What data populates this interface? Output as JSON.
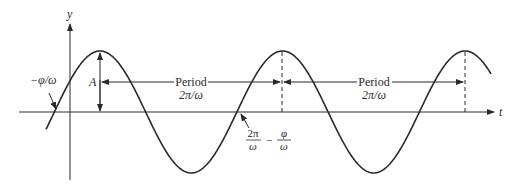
{
  "diagram": {
    "type": "sinusoid",
    "axes": {
      "y_label": "y",
      "x_label": "t"
    },
    "labels": {
      "amplitude": "A",
      "phase_shift": "−φ/ω",
      "period1_title": "Period",
      "period1_value": "2π/ω",
      "period2_title": "Period",
      "period2_value": "2π/ω",
      "zero_crossing_num1": "2π",
      "zero_crossing_den1": "ω",
      "zero_crossing_minus": "−",
      "zero_crossing_num2": "φ",
      "zero_crossing_den2": "ω"
    },
    "colors": {
      "line": "#2a2a2a",
      "background": "#ffffff"
    }
  }
}
